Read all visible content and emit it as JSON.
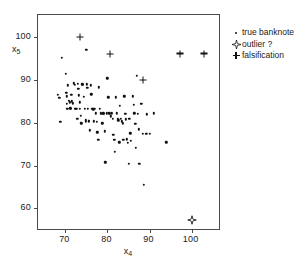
{
  "chart_data": {
    "type": "scatter",
    "title": "",
    "xlabel": "x4",
    "ylabel": "x5",
    "xlim": [
      63.5,
      106.5
    ],
    "ylim": [
      55.2,
      105.2
    ],
    "grid": false,
    "legend_position": "right",
    "xticks": [
      70,
      80,
      90,
      100
    ],
    "yticks": [
      60,
      70,
      80,
      90,
      100
    ],
    "xtick_labels": [
      "70",
      "80",
      "90",
      "100"
    ],
    "ytick_labels": [
      "60",
      "70",
      "80",
      "90",
      "100"
    ],
    "series": [
      {
        "name": "true banknote",
        "marker": "dot",
        "points": [
          [
            68.2,
            86.5
          ],
          [
            68.6,
            85.8
          ],
          [
            68.8,
            80.2
          ],
          [
            69.2,
            95.2
          ],
          [
            70.1,
            91.5
          ],
          [
            70.2,
            87.0
          ],
          [
            70.3,
            86.2
          ],
          [
            70.4,
            84.4
          ],
          [
            70.5,
            83.3
          ],
          [
            70.6,
            88.8
          ],
          [
            70.8,
            85.2
          ],
          [
            71.0,
            84.8
          ],
          [
            71.2,
            83.4
          ],
          [
            71.3,
            83.3
          ],
          [
            71.4,
            86.6
          ],
          [
            71.6,
            85.0
          ],
          [
            71.8,
            84.6
          ],
          [
            72.0,
            89.2
          ],
          [
            72.2,
            88.9
          ],
          [
            72.4,
            83.3
          ],
          [
            72.6,
            83.3
          ],
          [
            72.8,
            81.0
          ],
          [
            73.0,
            89.1
          ],
          [
            73.1,
            88.0
          ],
          [
            73.2,
            86.4
          ],
          [
            73.4,
            84.8
          ],
          [
            73.5,
            83.3
          ],
          [
            73.6,
            81.6
          ],
          [
            73.8,
            79.9
          ],
          [
            74.0,
            89.0
          ],
          [
            74.2,
            88.9
          ],
          [
            74.4,
            86.1
          ],
          [
            74.6,
            83.3
          ],
          [
            74.8,
            80.6
          ],
          [
            74.9,
            80.3
          ],
          [
            75.0,
            97.0
          ],
          [
            75.1,
            89.0
          ],
          [
            75.2,
            88.2
          ],
          [
            75.4,
            83.3
          ],
          [
            75.5,
            80.5
          ],
          [
            75.6,
            80.4
          ],
          [
            75.8,
            78.3
          ],
          [
            76.0,
            88.8
          ],
          [
            76.2,
            86.7
          ],
          [
            76.4,
            83.3
          ],
          [
            76.6,
            83.2
          ],
          [
            76.8,
            80.4
          ],
          [
            77.0,
            83.3
          ],
          [
            77.2,
            82.2
          ],
          [
            77.4,
            80.2
          ],
          [
            77.6,
            77.8
          ],
          [
            77.8,
            76.0
          ],
          [
            78.0,
            88.3
          ],
          [
            78.2,
            83.3
          ],
          [
            78.4,
            82.2
          ],
          [
            78.6,
            82.1
          ],
          [
            78.8,
            79.9
          ],
          [
            79.0,
            82.2
          ],
          [
            79.2,
            82.1
          ],
          [
            79.4,
            78.0
          ],
          [
            79.5,
            70.8
          ],
          [
            79.8,
            82.2
          ],
          [
            80.0,
            90.4
          ],
          [
            80.2,
            86.0
          ],
          [
            80.4,
            82.2
          ],
          [
            80.6,
            82.1
          ],
          [
            80.8,
            81.5
          ],
          [
            81.0,
            82.2
          ],
          [
            81.2,
            81.0
          ],
          [
            81.4,
            77.2
          ],
          [
            81.6,
            76.1
          ],
          [
            81.8,
            73.3
          ],
          [
            82.0,
            86.0
          ],
          [
            82.2,
            82.2
          ],
          [
            82.4,
            81.0
          ],
          [
            82.6,
            80.6
          ],
          [
            82.8,
            75.5
          ],
          [
            83.0,
            84.0
          ],
          [
            83.2,
            81.0
          ],
          [
            83.4,
            80.4
          ],
          [
            83.6,
            79.9
          ],
          [
            83.8,
            76.0
          ],
          [
            84.0,
            86.2
          ],
          [
            84.2,
            82.1
          ],
          [
            84.4,
            80.8
          ],
          [
            84.6,
            76.2
          ],
          [
            84.8,
            75.4
          ],
          [
            85.0,
            70.5
          ],
          [
            85.2,
            81.0
          ],
          [
            85.4,
            77.6
          ],
          [
            85.6,
            75.8
          ],
          [
            86.0,
            86.2
          ],
          [
            86.2,
            84.2
          ],
          [
            86.4,
            82.2
          ],
          [
            86.6,
            79.8
          ],
          [
            86.8,
            74.2
          ],
          [
            87.0,
            91.0
          ],
          [
            87.2,
            82.1
          ],
          [
            87.4,
            78.5
          ],
          [
            87.6,
            70.4
          ],
          [
            88.0,
            84.5
          ],
          [
            88.4,
            77.5
          ],
          [
            88.6,
            65.5
          ],
          [
            89.2,
            77.4
          ],
          [
            89.4,
            82.0
          ],
          [
            90.0,
            77.4
          ],
          [
            91.0,
            82.2
          ],
          [
            94.0,
            75.5
          ]
        ]
      },
      {
        "name": "falsification",
        "marker": "plus",
        "points": [
          [
            73.5,
            100.0
          ],
          [
            80.6,
            96.1
          ],
          [
            88.4,
            90.0
          ],
          [
            97.2,
            96.2
          ],
          [
            103.0,
            96.2
          ]
        ]
      },
      {
        "name": "outlier ?",
        "marker": "star",
        "points": [
          [
            100.0,
            57.4
          ]
        ]
      }
    ]
  },
  "axes": {
    "y_title_base": "x",
    "y_title_sub": "5",
    "x_title_base": "x",
    "x_title_sub": "4"
  },
  "legend": {
    "items": [
      {
        "label": "true banknote",
        "symbol": "dot-icon"
      },
      {
        "label": "outlier ?",
        "symbol": "four-point-star-icon"
      },
      {
        "label": "falsification",
        "symbol": "plus-icon"
      }
    ]
  },
  "colors": {
    "marker": "#111111",
    "frame": "#4a4a4a",
    "background": "#ffffff"
  }
}
